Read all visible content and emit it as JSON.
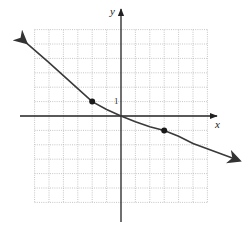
{
  "chart_data": {
    "type": "line",
    "title": "",
    "xlabel": "x",
    "ylabel": "y",
    "xlim": [
      -6,
      6
    ],
    "ylim": [
      -6,
      6
    ],
    "grid": true,
    "grid_style": "dotted",
    "tick_labels": {
      "x_unit": "1",
      "y_unit": "1"
    },
    "series": [
      {
        "name": "curve",
        "x": [
          -6.6,
          -5,
          -4,
          -3,
          -2,
          -1,
          0,
          1,
          2,
          3,
          4,
          5,
          8.2
        ],
        "y": [
          5.1,
          3.7,
          2.8,
          1.9,
          1.0,
          0.45,
          0,
          -0.4,
          -0.75,
          -1.0,
          -1.4,
          -1.9,
          -3.1
        ],
        "arrows": "both"
      }
    ],
    "marked_points": [
      {
        "x": -2,
        "y": 1
      },
      {
        "x": 3,
        "y": -1
      }
    ]
  },
  "labels": {
    "x_axis": "x",
    "y_axis": "y",
    "unit_tick": "1"
  }
}
